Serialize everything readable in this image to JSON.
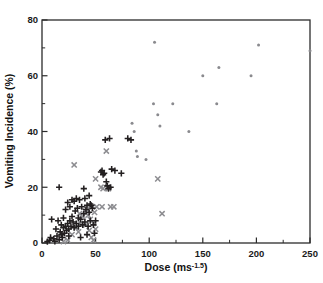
{
  "figure": {
    "background_color": "#ffffff",
    "has_title": false,
    "frame_color": "#2b2b2b"
  },
  "axes": {
    "x": {
      "label_main": "Dose (ms",
      "label_sup": "-1.5",
      "label_close": ")",
      "label_full": "Dose (ms-1.5)",
      "ticks": [
        "0",
        "50",
        "100",
        "150",
        "200",
        "250"
      ],
      "tick_values": [
        0,
        50,
        100,
        150,
        200,
        250
      ],
      "minor_tick_values": [
        25,
        75,
        125,
        175,
        225
      ],
      "range": [
        0,
        250
      ]
    },
    "y": {
      "label_full": "Vomiting Incidence (%)",
      "ticks": [
        "0",
        "20",
        "40",
        "60",
        "80"
      ],
      "tick_values": [
        0,
        20,
        40,
        60,
        80
      ],
      "minor_tick_values": [
        10,
        30,
        50,
        70
      ],
      "range": [
        0,
        80
      ]
    }
  },
  "colors": {
    "plus_marker": "#231f20",
    "ex_marker": "#8c8c90",
    "dot_marker": "#8a8a8e",
    "axis": "#2b2b2b",
    "text": "#121212"
  },
  "chart_data": {
    "type": "scatter",
    "title": "",
    "xlabel": "Dose (ms-1.5)",
    "ylabel": "Vomiting Incidence (%)",
    "xlim": [
      0,
      250
    ],
    "ylim": [
      0,
      80
    ],
    "grid": false,
    "legend": "none",
    "series": [
      {
        "name": "plus",
        "marker": "plus",
        "color": "#231f20",
        "points": [
          [
            5,
            0.5
          ],
          [
            7,
            1.0
          ],
          [
            8,
            2.0
          ],
          [
            9,
            8.5
          ],
          [
            11,
            1.5
          ],
          [
            12,
            0.6
          ],
          [
            13,
            5.0
          ],
          [
            14,
            2.5
          ],
          [
            15,
            8.0
          ],
          [
            16,
            1.2
          ],
          [
            16,
            20.0
          ],
          [
            17,
            4.0
          ],
          [
            18,
            3.0
          ],
          [
            18,
            6.5
          ],
          [
            19,
            2.0
          ],
          [
            20,
            5.5
          ],
          [
            20,
            9.0
          ],
          [
            21,
            3.5
          ],
          [
            22,
            12.0
          ],
          [
            22,
            6.0
          ],
          [
            23,
            4.5
          ],
          [
            24,
            14.5
          ],
          [
            24,
            7.0
          ],
          [
            25,
            2.5
          ],
          [
            25,
            5.0
          ],
          [
            26,
            13.0
          ],
          [
            26,
            8.0
          ],
          [
            27,
            6.0
          ],
          [
            28,
            15.5
          ],
          [
            28,
            9.5
          ],
          [
            29,
            7.5
          ],
          [
            30,
            15.0
          ],
          [
            30,
            5.5
          ],
          [
            31,
            11.5
          ],
          [
            32,
            16.0
          ],
          [
            32,
            7.0
          ],
          [
            33,
            12.5
          ],
          [
            34,
            6.0
          ],
          [
            34,
            9.0
          ],
          [
            35,
            15.5
          ],
          [
            36,
            8.5
          ],
          [
            36,
            2.0
          ],
          [
            37,
            13.0
          ],
          [
            38,
            6.5
          ],
          [
            39,
            19.5
          ],
          [
            39,
            10.5
          ],
          [
            40,
            16.0
          ],
          [
            40,
            7.5
          ],
          [
            41,
            12.0
          ],
          [
            42,
            13.5
          ],
          [
            42,
            3.0
          ],
          [
            43,
            6.0
          ],
          [
            44,
            17.0
          ],
          [
            44,
            11.0
          ],
          [
            45,
            14.0
          ],
          [
            45,
            8.0
          ],
          [
            46,
            13.5
          ],
          [
            47,
            12.5
          ],
          [
            48,
            6.5
          ],
          [
            49,
            3.5
          ],
          [
            50,
            8.0
          ],
          [
            55,
            25.5
          ],
          [
            56,
            26.0
          ],
          [
            57,
            24.5
          ],
          [
            58,
            25.0
          ],
          [
            59,
            37.0
          ],
          [
            60,
            22.0
          ],
          [
            61,
            20.5
          ],
          [
            62,
            19.5
          ],
          [
            63,
            37.5
          ],
          [
            64,
            20.0
          ],
          [
            65,
            26.5
          ],
          [
            68,
            26.0
          ],
          [
            74,
            25.0
          ],
          [
            80,
            37.5
          ],
          [
            83,
            37.0
          ]
        ]
      },
      {
        "name": "x-cross",
        "marker": "x",
        "color": "#8c8c90",
        "points": [
          [
            20,
            0.5
          ],
          [
            24,
            1.0
          ],
          [
            28,
            3.0
          ],
          [
            30,
            28.0
          ],
          [
            32,
            5.5
          ],
          [
            34,
            4.0
          ],
          [
            35,
            10.5
          ],
          [
            36,
            7.0
          ],
          [
            38,
            9.5
          ],
          [
            40,
            11.5
          ],
          [
            41,
            6.5
          ],
          [
            42,
            12.0
          ],
          [
            43,
            10.0
          ],
          [
            44,
            4.5
          ],
          [
            45,
            8.5
          ],
          [
            46,
            2.0
          ],
          [
            47,
            13.0
          ],
          [
            48,
            7.0
          ],
          [
            48,
            1.0
          ],
          [
            49,
            11.0
          ],
          [
            50,
            23.0
          ],
          [
            50,
            5.0
          ],
          [
            51,
            13.0
          ],
          [
            55,
            20.0
          ],
          [
            56,
            13.0
          ],
          [
            57,
            19.5
          ],
          [
            60,
            33.0
          ],
          [
            61,
            20.0
          ],
          [
            62,
            19.5
          ],
          [
            64,
            13.0
          ],
          [
            67,
            13.0
          ],
          [
            108,
            23.0
          ],
          [
            112,
            10.5
          ]
        ]
      },
      {
        "name": "dot",
        "marker": "dot",
        "color": "#8a8a8e",
        "points": [
          [
            84,
            43.0
          ],
          [
            86,
            40.0
          ],
          [
            88,
            33.0
          ],
          [
            89,
            31.0
          ],
          [
            97,
            30.0
          ],
          [
            104,
            50.0
          ],
          [
            105,
            72.0
          ],
          [
            108,
            46.0
          ],
          [
            110,
            42.0
          ],
          [
            122,
            50.0
          ],
          [
            137,
            40.0
          ],
          [
            150,
            60.0
          ],
          [
            163,
            50.0
          ],
          [
            165,
            63.0
          ],
          [
            195,
            60.0
          ],
          [
            202,
            71.0
          ],
          [
            250,
            69.0
          ]
        ]
      }
    ]
  }
}
